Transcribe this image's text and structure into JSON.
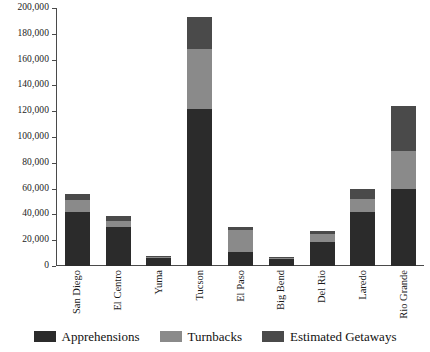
{
  "chart_data": {
    "type": "bar",
    "stacked": true,
    "title": "",
    "subtitle": "",
    "xlabel": "",
    "ylabel": "",
    "ylim": [
      0,
      200000
    ],
    "grid": false,
    "legend_position": "bottom",
    "categories": [
      "San Diego",
      "El Centro",
      "Yuma",
      "Tucson",
      "El Paso",
      "Big Bend",
      "Del Rio",
      "Laredo",
      "Rio Grande"
    ],
    "y_ticks": [
      0,
      20000,
      40000,
      60000,
      80000,
      100000,
      120000,
      140000,
      160000,
      180000,
      200000
    ],
    "y_tick_labels": [
      "0",
      "20,000",
      "40,000",
      "60,000",
      "80,000",
      "100,000",
      "120,000",
      "140,000",
      "160,000",
      "180,000",
      "200,000"
    ],
    "series": [
      {
        "name": "Apprehensions",
        "color": "#2b2b2b",
        "values": [
          42000,
          30000,
          6500,
          122000,
          11000,
          5500,
          19000,
          42000,
          60000
        ]
      },
      {
        "name": "Turnbacks",
        "color": "#8a8a8a",
        "values": [
          9000,
          5000,
          800,
          46000,
          17000,
          900,
          5500,
          10000,
          29000
        ]
      },
      {
        "name": "Estimated Getaways",
        "color": "#4a4a4a",
        "values": [
          5000,
          4000,
          700,
          25000,
          2000,
          600,
          2500,
          8000,
          35000
        ]
      }
    ],
    "totals": [
      56000,
      39000,
      8000,
      193000,
      30000,
      7000,
      27000,
      60000,
      124000
    ]
  },
  "legend": {
    "items": [
      {
        "label": "Apprehensions",
        "color": "#2b2b2b"
      },
      {
        "label": "Turnbacks",
        "color": "#8a8a8a"
      },
      {
        "label": "Estimated Getaways",
        "color": "#4a4a4a"
      }
    ]
  },
  "colors": {
    "axis": "#4a4a4a",
    "background": "#ffffff",
    "text": "#1a1a1a"
  }
}
